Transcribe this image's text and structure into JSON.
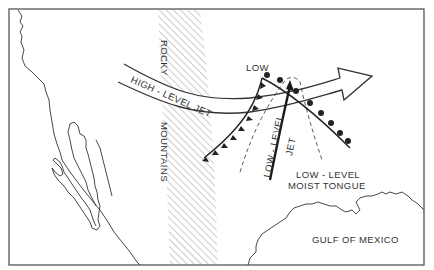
{
  "diagram": {
    "colors": {
      "ink": "#333333",
      "frame": "#555555",
      "hatch": "#9a9a9a",
      "background": "#ffffff"
    },
    "labels": {
      "rocky": "ROCKY",
      "mountains": "MOUNTAINS",
      "high_jet": "HIGH - LEVEL   JET",
      "low": "LOW",
      "low_jet_1": "LOW - LEVEL",
      "low_jet_2": "JET",
      "moist_1": "LOW - LEVEL",
      "moist_2": "MOIST TONGUE",
      "gulf": "GULF OF MEXICO"
    },
    "features": [
      {
        "name": "Rocky Mountains",
        "symbol": "diagonal hatching band"
      },
      {
        "name": "High-level jet",
        "symbol": "broad hollow arrow pointing east-northeast"
      },
      {
        "name": "Low",
        "symbol": "text label at frontal junction"
      },
      {
        "name": "Cold front",
        "symbol": "line with triangles, extending southwest from low"
      },
      {
        "name": "Warm front",
        "symbol": "line with semicircles, extending southeast from low"
      },
      {
        "name": "Low-level jet",
        "symbol": "heavy line with arrow pointing north"
      },
      {
        "name": "Low-level moist tongue",
        "symbol": "dashed tongue outline"
      },
      {
        "name": "Coastlines",
        "symbol": "thin outline (Pacific coast, Baja California, Gulf coast)"
      }
    ]
  }
}
